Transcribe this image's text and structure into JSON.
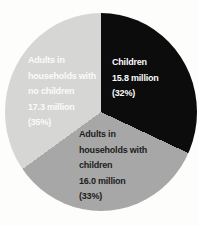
{
  "background_color": "#fdfdfc",
  "chart_data": {
    "type": "pie",
    "title": "",
    "unit": "million people",
    "direction": "clockwise",
    "start_angle_deg": 0,
    "legend_position": "none",
    "labels_inside": true,
    "slices": [
      {
        "category": "Children",
        "value_millions": 15.8,
        "percent": 32,
        "color": "#0c0c0c",
        "label_text_color": "#fbfbfb",
        "label_lines": [
          "Children",
          "15.8 million",
          "(32%)"
        ]
      },
      {
        "category": "Adults in households with children",
        "value_millions": 16.0,
        "percent": 33,
        "color": "#a7a7a7",
        "label_text_color": "#1c1c1c",
        "label_lines": [
          "Adults in",
          "households with",
          "children",
          "16.0 million",
          "(33%)"
        ]
      },
      {
        "category": "Adults in households with no children",
        "value_millions": 17.3,
        "percent": 35,
        "color": "#d6d6d5",
        "label_text_color": "#fbfbfb",
        "label_lines": [
          "Adults in",
          "households with",
          "no children",
          "17.3 million",
          "(35%)"
        ]
      }
    ]
  }
}
